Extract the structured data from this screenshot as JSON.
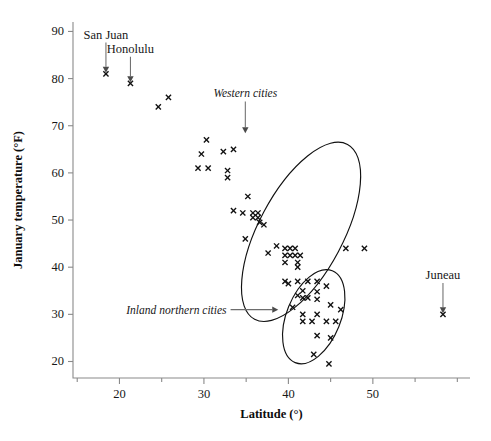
{
  "chart_data": {
    "type": "scatter",
    "title": "",
    "xlabel": "Latitude (°)",
    "ylabel": "January temperature (°F)",
    "xlim": [
      14.5,
      61.5
    ],
    "ylim": [
      16.5,
      92
    ],
    "xticks": [
      20,
      30,
      40,
      50
    ],
    "xminorticks": [
      15,
      25,
      35,
      45,
      55,
      60
    ],
    "yticks": [
      20,
      30,
      40,
      50,
      60,
      70,
      80,
      90
    ],
    "grid": false,
    "legend": null,
    "marker": "x",
    "points": [
      {
        "x": 18.4,
        "y": 81
      },
      {
        "x": 21.3,
        "y": 79
      },
      {
        "x": 24.6,
        "y": 74
      },
      {
        "x": 25.8,
        "y": 76
      },
      {
        "x": 30.3,
        "y": 67
      },
      {
        "x": 29.7,
        "y": 64
      },
      {
        "x": 32.3,
        "y": 64.5
      },
      {
        "x": 33.5,
        "y": 65
      },
      {
        "x": 29.3,
        "y": 61
      },
      {
        "x": 30.5,
        "y": 61
      },
      {
        "x": 32.8,
        "y": 60.5
      },
      {
        "x": 32.8,
        "y": 59
      },
      {
        "x": 35.2,
        "y": 55
      },
      {
        "x": 33.5,
        "y": 52
      },
      {
        "x": 34.6,
        "y": 51.5
      },
      {
        "x": 35.8,
        "y": 51.5
      },
      {
        "x": 36.4,
        "y": 51.5
      },
      {
        "x": 35.8,
        "y": 50.5
      },
      {
        "x": 36.4,
        "y": 50.5
      },
      {
        "x": 36.6,
        "y": 49.5
      },
      {
        "x": 37.1,
        "y": 49
      },
      {
        "x": 34.9,
        "y": 46
      },
      {
        "x": 38.6,
        "y": 44.5
      },
      {
        "x": 39.6,
        "y": 44
      },
      {
        "x": 40.2,
        "y": 44
      },
      {
        "x": 40.8,
        "y": 44
      },
      {
        "x": 37.6,
        "y": 43
      },
      {
        "x": 39.6,
        "y": 42.5
      },
      {
        "x": 40.2,
        "y": 42.5
      },
      {
        "x": 40.8,
        "y": 42.5
      },
      {
        "x": 41.4,
        "y": 42.5
      },
      {
        "x": 39.6,
        "y": 41
      },
      {
        "x": 41.1,
        "y": 41
      },
      {
        "x": 41.1,
        "y": 40
      },
      {
        "x": 46.8,
        "y": 44
      },
      {
        "x": 49.0,
        "y": 44
      },
      {
        "x": 39.6,
        "y": 37
      },
      {
        "x": 41.1,
        "y": 37
      },
      {
        "x": 42.3,
        "y": 37
      },
      {
        "x": 43.4,
        "y": 37
      },
      {
        "x": 40.0,
        "y": 36.5
      },
      {
        "x": 44.5,
        "y": 36
      },
      {
        "x": 41.7,
        "y": 35
      },
      {
        "x": 43.4,
        "y": 34.8
      },
      {
        "x": 41.1,
        "y": 34
      },
      {
        "x": 41.7,
        "y": 33.5
      },
      {
        "x": 42.3,
        "y": 33.5
      },
      {
        "x": 43.4,
        "y": 33.2
      },
      {
        "x": 40.5,
        "y": 31.5
      },
      {
        "x": 45.0,
        "y": 32
      },
      {
        "x": 46.2,
        "y": 31
      },
      {
        "x": 41.7,
        "y": 30
      },
      {
        "x": 43.4,
        "y": 30
      },
      {
        "x": 41.7,
        "y": 28.5
      },
      {
        "x": 42.8,
        "y": 28.5
      },
      {
        "x": 44.5,
        "y": 28.5
      },
      {
        "x": 45.6,
        "y": 28.5
      },
      {
        "x": 43.4,
        "y": 25.5
      },
      {
        "x": 45.0,
        "y": 25
      },
      {
        "x": 43.0,
        "y": 21.5
      },
      {
        "x": 44.8,
        "y": 19.5
      },
      {
        "x": 58.3,
        "y": 30
      }
    ],
    "annotations": [
      {
        "name": "san-juan",
        "text": "San Juan",
        "target_x": 18.4,
        "target_y": 81,
        "label_x": 20.0,
        "label_y": 88.5,
        "style": "upright"
      },
      {
        "name": "honolulu",
        "text": "Honolulu",
        "target_x": 21.3,
        "target_y": 79,
        "label_x": 23.3,
        "label_y": 85.5,
        "style": "upright"
      },
      {
        "name": "juneau",
        "text": "Juneau",
        "target_x": 58.3,
        "target_y": 30,
        "label_x": 58.3,
        "label_y": 37.5,
        "style": "upright"
      },
      {
        "name": "western-cities",
        "text": "Western cities",
        "target_x": 34.9,
        "target_y": 68.2,
        "label_x": 36.0,
        "label_y": 76.0,
        "style": "italic"
      },
      {
        "name": "inland-northern-cities",
        "text": "Inland northern cities",
        "target_x": 38.8,
        "target_y": 31.0,
        "label_x": 27.0,
        "label_y": 31.0,
        "style": "italic-left"
      }
    ],
    "clusters": [
      {
        "name": "western-cities-ellipse",
        "cx": 41.5,
        "cy": 47.5,
        "rx": 5.0,
        "ry": 21.0,
        "rotation": 28
      },
      {
        "name": "inland-northern-cities-ellipse",
        "cx": 43.0,
        "cy": 29.5,
        "rx": 3.2,
        "ry": 10.5,
        "rotation": 22
      }
    ]
  }
}
